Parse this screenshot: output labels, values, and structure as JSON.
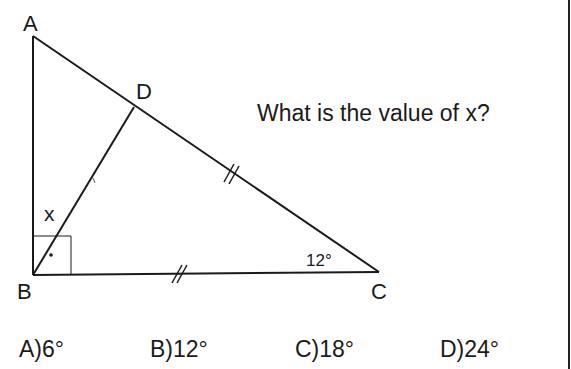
{
  "question": {
    "text": "What is the value of x?"
  },
  "figure": {
    "vertices": {
      "A": {
        "label": "A"
      },
      "B": {
        "label": "B"
      },
      "C": {
        "label": "C"
      },
      "D": {
        "label": "D"
      }
    },
    "angle_labels": {
      "x": "x",
      "angle_C": "12°"
    },
    "marks": {
      "right_angle_at": "B",
      "equal_segments": [
        "DC",
        "BC"
      ]
    },
    "stroke_color": "#1a1a1a"
  },
  "choices": [
    {
      "letter": "A)",
      "value": "6°"
    },
    {
      "letter": "B)",
      "value": "12°"
    },
    {
      "letter": "C)",
      "value": "18°"
    },
    {
      "letter": "D)",
      "value": "24°"
    }
  ]
}
